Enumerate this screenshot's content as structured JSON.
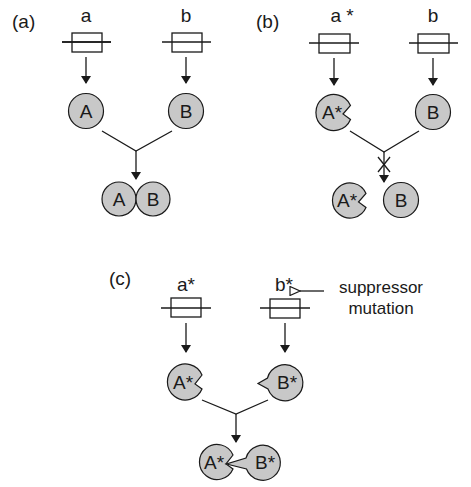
{
  "figure": {
    "panels": [
      {
        "id": "a",
        "label": "(a)",
        "genes": [
          {
            "name": "a",
            "label": "a"
          },
          {
            "name": "b",
            "label": "b"
          }
        ],
        "proteins": [
          {
            "name": "A",
            "label": "A",
            "mutant": false
          },
          {
            "name": "B",
            "label": "B",
            "mutant": false
          }
        ],
        "complex": [
          {
            "label": "A"
          },
          {
            "label": "B"
          }
        ],
        "interaction": "binds"
      },
      {
        "id": "b",
        "label": "(b)",
        "genes": [
          {
            "name": "a-star",
            "label": "a *"
          },
          {
            "name": "b",
            "label": "b"
          }
        ],
        "proteins": [
          {
            "name": "A-star",
            "label": "A*",
            "mutant": true
          },
          {
            "name": "B",
            "label": "B",
            "mutant": false
          }
        ],
        "complex": [
          {
            "label": "A*"
          },
          {
            "label": "B"
          }
        ],
        "interaction": "blocked"
      },
      {
        "id": "c",
        "label": "(c)",
        "genes": [
          {
            "name": "a-star",
            "label": "a*"
          },
          {
            "name": "b-star",
            "label": "b*"
          }
        ],
        "proteins": [
          {
            "name": "A-star",
            "label": "A*",
            "mutant": true
          },
          {
            "name": "B-star",
            "label": "B*",
            "mutant": true
          }
        ],
        "complex": [
          {
            "label": "A*"
          },
          {
            "label": "B*"
          }
        ],
        "interaction": "binds",
        "annotation": {
          "line1": "suppressor",
          "line2": "mutation",
          "target": "b*"
        }
      }
    ],
    "colors": {
      "protein_fill": "#c8c8c8",
      "stroke": "#1a1a1a",
      "background": "#ffffff"
    }
  }
}
